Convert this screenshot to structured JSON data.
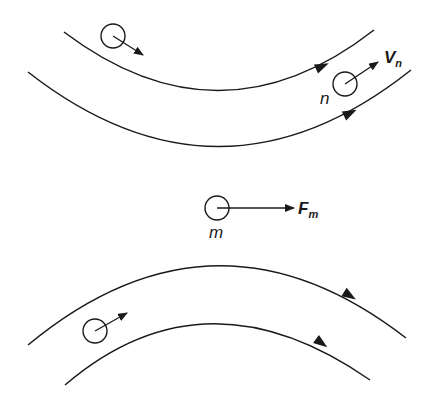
{
  "diagram": {
    "background": "#ffffff",
    "stroke_color": "#1a1a1a",
    "top_streamlines": [
      {
        "name": "upper",
        "path": "M64,32 Q220,150 374,30",
        "arrow": {
          "x": 322,
          "y": 66,
          "angle": -24
        }
      },
      {
        "name": "lower",
        "path": "M28,72 Q220,222 411,70",
        "arrow": {
          "x": 350,
          "y": 113,
          "angle": -26
        }
      }
    ],
    "bottom_streamlines": [
      {
        "name": "outer",
        "path": "M28,345 Q215,190 406,338",
        "arrow": {
          "x": 357,
          "y": 302,
          "angle": 32
        }
      },
      {
        "name": "inner",
        "path": "M65,385 Q205,265 370,380",
        "arrow": {
          "x": 328,
          "y": 348,
          "angle": 36
        }
      }
    ],
    "particles": [
      {
        "id": "top-left",
        "cx": 113,
        "cy": 36,
        "r": 12,
        "vector_to": [
          143,
          55
        ]
      },
      {
        "id": "n",
        "cx": 345,
        "cy": 84,
        "r": 12,
        "vector_to": [
          378,
          62
        ]
      },
      {
        "id": "m",
        "cx": 217,
        "cy": 208,
        "r": 12,
        "vector_to": [
          294,
          208
        ]
      },
      {
        "id": "bottom-left",
        "cx": 95,
        "cy": 331,
        "r": 12,
        "vector_to": [
          127,
          313
        ]
      }
    ],
    "labels": {
      "n_label": "n",
      "vn_main": "V",
      "vn_sub": "n",
      "m_label": "m",
      "fm_main": "F",
      "fm_sub": "m"
    }
  }
}
